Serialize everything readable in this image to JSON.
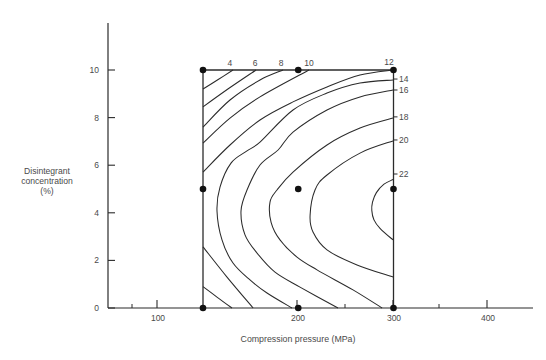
{
  "chart_data": {
    "type": "line",
    "subtype": "contour",
    "title": "",
    "xlabel": "Compression pressure (MPa)",
    "ylabel_lines": [
      "Disintegrant",
      "concentration",
      "(%)"
    ],
    "ylabel": "Disintegrant concentration (%)",
    "x_ticks": [
      100,
      200,
      300,
      400
    ],
    "y_ticks": [
      0,
      2,
      4,
      6,
      8,
      10
    ],
    "xlim": [
      0,
      450
    ],
    "ylim": [
      0,
      12
    ],
    "grid": false,
    "legend": null,
    "design_region": {
      "x": [
        100,
        300
      ],
      "y": [
        0,
        10
      ]
    },
    "design_points": [
      [
        100,
        10
      ],
      [
        200,
        10
      ],
      [
        300,
        10
      ],
      [
        100,
        5
      ],
      [
        200,
        5
      ],
      [
        300,
        5
      ],
      [
        100,
        0
      ],
      [
        200,
        0
      ],
      [
        300,
        0
      ]
    ],
    "contour_levels": [
      4,
      6,
      8,
      10,
      12,
      14,
      16,
      18,
      20,
      22
    ],
    "contours": [
      {
        "level": 4,
        "segments": [
          [
            [
              131.5,
              10
            ],
            [
              116,
              9.6
            ],
            [
              100,
              9.2
            ]
          ],
          [
            [
              100,
              0.9
            ],
            [
              115,
              0.45
            ],
            [
              130.4,
              0
            ]
          ]
        ]
      },
      {
        "level": 6,
        "segments": [
          [
            [
              155.6,
              10
            ],
            [
              128,
              9.25
            ],
            [
              100,
              8.45
            ]
          ],
          [
            [
              100,
              2.57
            ],
            [
              125,
              1.31
            ],
            [
              152.6,
              0
            ]
          ]
        ]
      },
      {
        "level": 8,
        "segments": [
          [
            [
              184,
              10
            ],
            [
              159.8,
              9.58
            ],
            [
              128.3,
              8.74
            ],
            [
              100,
              7.6
            ]
          ]
        ]
      },
      {
        "level": 10,
        "segments": [
          [
            [
              211.3,
              10
            ],
            [
              159.8,
              8.87
            ],
            [
              128.3,
              7.98
            ],
            [
              100,
              6.93
            ]
          ]
        ]
      },
      {
        "level": 12,
        "segments": [
          [
            [
              299.5,
              10
            ],
            [
              264.8,
              9.79
            ],
            [
              230.2,
              9.29
            ],
            [
              194.5,
              8.66
            ],
            [
              159.8,
              7.9
            ],
            [
              128.3,
              6.85
            ],
            [
              100,
              5.71
            ]
          ]
        ]
      },
      {
        "level": 14,
        "segments": [
          [
            [
              299.5,
              9.58
            ],
            [
              264.8,
              9.45
            ],
            [
              230.2,
              9.03
            ],
            [
              194.5,
              8.32
            ],
            [
              159.8,
              6.97
            ],
            [
              146.2,
              6.6
            ],
            [
              129.4,
              6.09
            ],
            [
              117.8,
              5.08
            ],
            [
              114.7,
              4.08
            ],
            [
              119.9,
              2.86
            ],
            [
              131.5,
              1.89
            ],
            [
              149.3,
              1.18
            ],
            [
              167.2,
              0.63
            ],
            [
              193.4,
              0
            ]
          ]
        ]
      },
      {
        "level": 16,
        "segments": [
          [
            [
              299.5,
              9.16
            ],
            [
              264.8,
              8.87
            ],
            [
              230.2,
              8.32
            ],
            [
              194.5,
              7.39
            ],
            [
              178.8,
              6.64
            ],
            [
              159.8,
              6.01
            ],
            [
              146.2,
              4.96
            ],
            [
              139.9,
              4.08
            ],
            [
              144.1,
              3.07
            ],
            [
              156.7,
              2.31
            ],
            [
              175.6,
              1.51
            ],
            [
              201.8,
              0.88
            ],
            [
              241.7,
              0
            ]
          ]
        ]
      },
      {
        "level": 18,
        "segments": [
          [
            [
              299.5,
              7.98
            ],
            [
              264.8,
              7.56
            ],
            [
              230.2,
              6.85
            ],
            [
              194.5,
              5.71
            ],
            [
              177.7,
              4.96
            ],
            [
              170.3,
              4.45
            ],
            [
              171.5,
              3.6
            ],
            [
              180.8,
              2.86
            ],
            [
              198.7,
              2.14
            ],
            [
              219.7,
              1.6
            ],
            [
              257.5,
              0.76
            ],
            [
              288,
              0
            ]
          ]
        ]
      },
      {
        "level": 20,
        "segments": [
          [
            [
              299.5,
              7.02
            ],
            [
              264.8,
              6.51
            ],
            [
              230.2,
              5.59
            ],
            [
              217.6,
              4.96
            ],
            [
              212.4,
              3.9
            ],
            [
              215.5,
              3.19
            ],
            [
              230.2,
              2.44
            ],
            [
              261.7,
              1.81
            ],
            [
              299.5,
              1.3
            ]
          ]
        ]
      },
      {
        "level": 22,
        "segments": [
          [
            [
              299.5,
              5.4
            ],
            [
              290,
              5.2
            ],
            [
              282,
              4.85
            ],
            [
              278,
              4.45
            ],
            [
              277.2,
              4.1
            ],
            [
              279.5,
              3.7
            ],
            [
              285.8,
              3.35
            ],
            [
              299.5,
              2.86
            ]
          ]
        ]
      }
    ],
    "contour_labels": [
      {
        "text": "4",
        "x": 128.3,
        "y": 10.29,
        "side": "top"
      },
      {
        "text": "6",
        "x": 154.6,
        "y": 10.29,
        "side": "top"
      },
      {
        "text": "8",
        "x": 181.9,
        "y": 10.29,
        "side": "top"
      },
      {
        "text": "10",
        "x": 211.3,
        "y": 10.29,
        "side": "top"
      },
      {
        "text": "12",
        "x": 295.3,
        "y": 10.34,
        "side": "top"
      },
      {
        "text": "14",
        "x": 311.0,
        "y": 9.62,
        "side": "right"
      },
      {
        "text": "16",
        "x": 311.0,
        "y": 9.16,
        "side": "right"
      },
      {
        "text": "18",
        "x": 311.0,
        "y": 8.03,
        "side": "right"
      },
      {
        "text": "20",
        "x": 311.0,
        "y": 7.06,
        "side": "right"
      },
      {
        "text": "22",
        "x": 311.0,
        "y": 5.63,
        "side": "right"
      }
    ],
    "colors": {
      "line": "#2b2b2b",
      "text": "#4a4a4a",
      "point": "#111111",
      "background": "#ffffff"
    }
  }
}
